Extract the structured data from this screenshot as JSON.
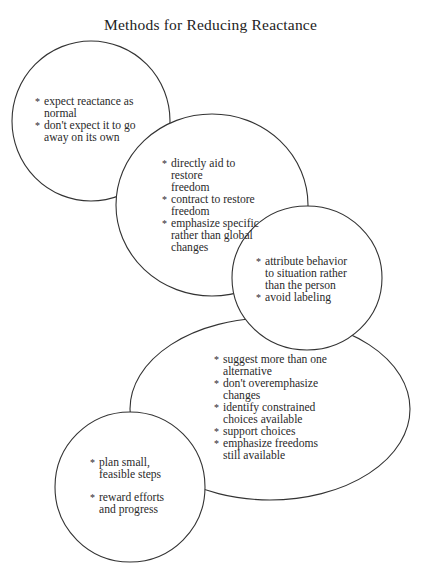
{
  "title": "Methods for Reducing Reactance",
  "stroke_color": "#333333",
  "bubbles": [
    {
      "id": "expect",
      "items": [
        "expect reactance as normal",
        "don't expect it to go away on its own"
      ]
    },
    {
      "id": "restore",
      "items": [
        "directly aid to restore freedom",
        "contract to restore freedom",
        "emphasize specific rather than global changes"
      ]
    },
    {
      "id": "attribute",
      "items": [
        "attribute behavior to situation rather than the person",
        "avoid labeling"
      ]
    },
    {
      "id": "choices",
      "items": [
        "suggest more than one alternative",
        "don't overemphasize changes",
        "identify constrained choices available",
        "support choices",
        "emphasize freedoms still available"
      ]
    },
    {
      "id": "steps",
      "items": [
        "plan small, feasible steps",
        "reward efforts and progress"
      ]
    }
  ]
}
